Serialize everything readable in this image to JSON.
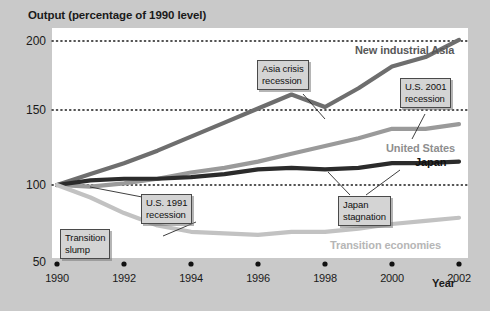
{
  "figure": {
    "background_color": "#c9c9c9",
    "plot_background_color": "#ffffff",
    "y_axis_title": "Output (percentage of 1990 level)",
    "x_axis_title": "Year"
  },
  "chart_data": {
    "type": "line",
    "title": "Output (percentage of 1990 level)",
    "xlabel": "Year",
    "ylabel": "Output (percentage of 1990 level)",
    "xlim": [
      1990,
      2002
    ],
    "ylim": [
      50,
      200
    ],
    "yticks": [
      50,
      100,
      150,
      200
    ],
    "ytick_labels": [
      "50",
      "100",
      "150",
      "200"
    ],
    "xticks": [
      1990,
      1992,
      1994,
      1996,
      1998,
      2000,
      2002
    ],
    "xtick_labels": [
      "1990",
      "1992",
      "1994",
      "1996",
      "1998",
      "2000",
      "2002"
    ],
    "grid": "horizontal-dotted",
    "legend": "inline-labels",
    "x": [
      1990,
      1991,
      1992,
      1993,
      1994,
      1995,
      1996,
      1997,
      1998,
      1999,
      2000,
      2001,
      2002
    ],
    "series": [
      {
        "name": "New industrial Asia",
        "color": "#6e6e6e",
        "width": 4.2,
        "values": [
          100,
          107,
          114,
          122,
          131,
          140,
          149,
          158,
          150,
          162,
          176,
          182,
          193
        ]
      },
      {
        "name": "United States",
        "color": "#9a9a9a",
        "width": 4.2,
        "values": [
          100,
          99,
          101,
          104,
          108,
          111,
          115,
          120,
          125,
          130,
          136,
          136,
          139
        ]
      },
      {
        "name": "Japan",
        "color": "#2b2b2b",
        "width": 4.2,
        "values": [
          100,
          103,
          104,
          104,
          105,
          107,
          110,
          111,
          110,
          111,
          114,
          114,
          115
        ]
      },
      {
        "name": "Transition economies",
        "color": "#c2c2c2",
        "width": 4.2,
        "values": [
          100,
          92,
          82,
          74,
          70,
          69,
          68,
          70,
          70,
          72,
          75,
          77,
          79
        ]
      }
    ],
    "series_labels": [
      {
        "text": "New industrial Asia",
        "color": "#6e6e6e"
      },
      {
        "text": "United States",
        "color": "#9a9a9a"
      },
      {
        "text": "Japan",
        "color": "#111111"
      },
      {
        "text": "Transition economies",
        "color": "#b6b6b6"
      }
    ],
    "annotations": [
      {
        "id": "asia-crisis",
        "line1": "Asia crisis",
        "line2": "recession",
        "points_to": "New industrial Asia 1998 dip"
      },
      {
        "id": "us-2001",
        "line1": "U.S. 2001",
        "line2": "recession",
        "points_to": "United States 2001 flat"
      },
      {
        "id": "us-1991",
        "line1": "U.S. 1991",
        "line2": "recession",
        "points_to": "United States 1991 dip"
      },
      {
        "id": "transition-slump",
        "line1": "Transition",
        "line2": "slump",
        "points_to": "Transition economies 1994 trough"
      },
      {
        "id": "japan-stagnation",
        "line1": "Japan",
        "line2": "stagnation",
        "points_to": "Japan 1998-2001 plateau"
      }
    ]
  },
  "caption": {
    "text": ""
  }
}
